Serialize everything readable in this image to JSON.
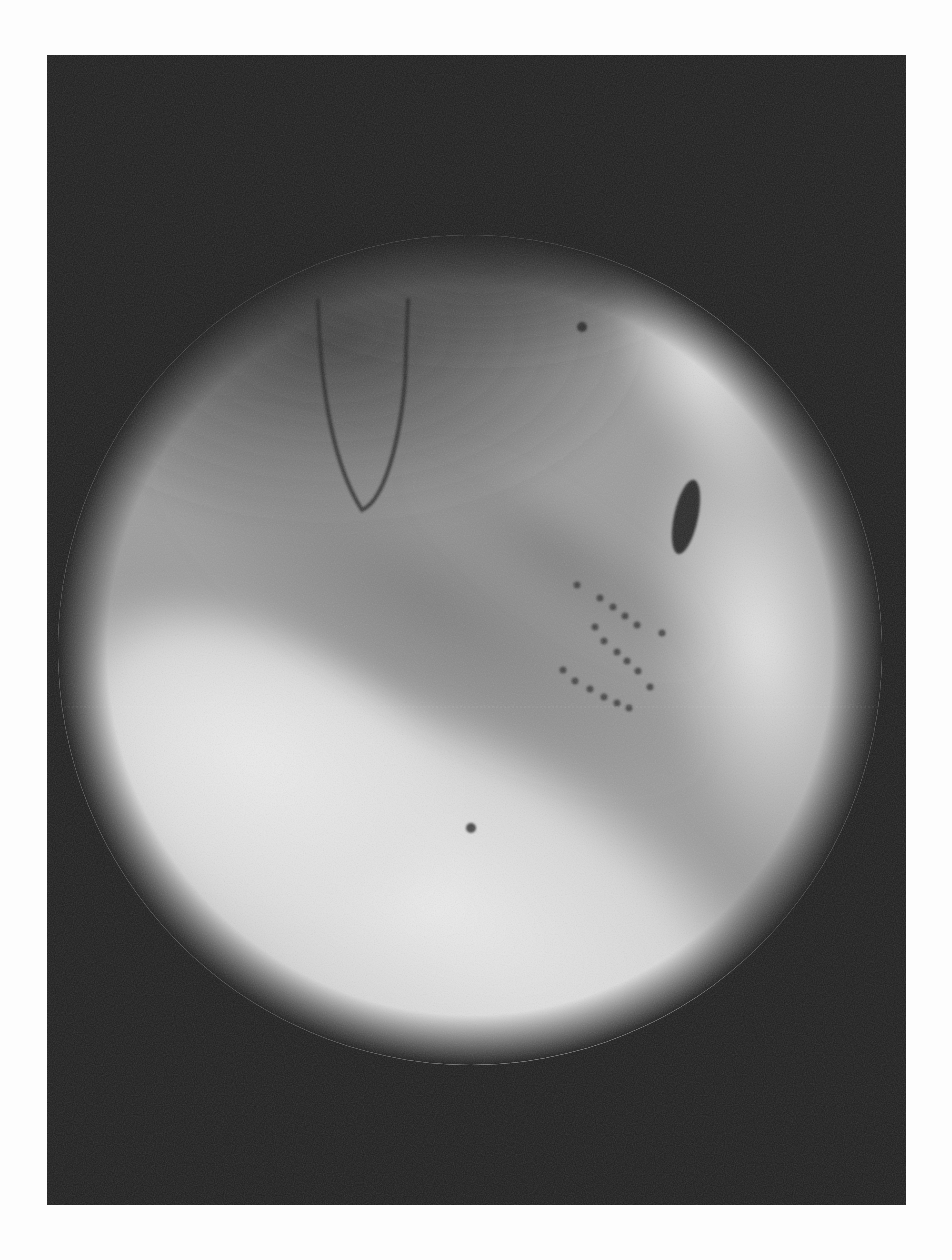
{
  "page": {
    "background": "#fdfdfd",
    "top_bleed_text": ""
  },
  "figure": {
    "frame": {
      "x": 47,
      "y": 55,
      "width": 859,
      "height": 1150,
      "background": "#1e1e1e"
    },
    "field_of_view": {
      "cx": 470,
      "cy": 650,
      "rx": 410,
      "ry": 410,
      "edge_color": "#1e1e1e",
      "bright_color": "#e8e8e8",
      "mid_color": "#8f8f8f"
    },
    "electrode_grid": {
      "dot_color": "#3a3a3a",
      "dot_radius": 3.5,
      "rows": [
        {
          "name": "row-a",
          "points": [
            [
              577,
              585
            ],
            [
              600,
              598
            ],
            [
              613,
              607
            ],
            [
              625,
              616
            ],
            [
              637,
              625
            ],
            [
              662,
              633
            ]
          ]
        },
        {
          "name": "row-b",
          "points": [
            [
              595,
              627
            ],
            [
              604,
              641
            ],
            [
              617,
              652
            ],
            [
              627,
              661
            ],
            [
              638,
              671
            ],
            [
              650,
              687
            ]
          ]
        },
        {
          "name": "row-c",
          "points": [
            [
              563,
              670
            ],
            [
              575,
              681
            ],
            [
              590,
              689
            ],
            [
              604,
              697
            ],
            [
              617,
              703
            ],
            [
              629,
              708
            ]
          ]
        }
      ]
    },
    "markers": [
      {
        "name": "upper-marker-dot",
        "cx": 582,
        "cy": 327,
        "r": 5,
        "color": "#2e2e2e"
      },
      {
        "name": "lower-marker-dot",
        "cx": 471,
        "cy": 828,
        "r": 5,
        "color": "#4a4a4a"
      }
    ],
    "oval_marker": {
      "cx": 686,
      "cy": 517,
      "rx": 12,
      "ry": 38,
      "rotate": 12,
      "color": "#2a2a2a"
    },
    "catheter_loop": {
      "path": "M 318 300 C 320 380, 330 460, 362 510 C 385 500, 400 440, 405 380 L 408 300",
      "color": "#262626",
      "width": 4
    }
  }
}
